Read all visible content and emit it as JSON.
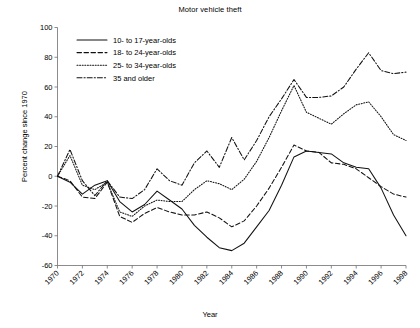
{
  "chart_data": {
    "type": "line",
    "title": "Motor vehicle theft",
    "xlabel": "Year",
    "ylabel": "Percent change since 1970",
    "xlim": [
      1970,
      1998
    ],
    "ylim": [
      -60,
      100
    ],
    "yticks": [
      100,
      80,
      60,
      40,
      20,
      0,
      -20,
      -40,
      -60
    ],
    "xticks": [
      1970,
      1972,
      1974,
      1976,
      1978,
      1980,
      1982,
      1984,
      1986,
      1988,
      1990,
      1992,
      1994,
      1996,
      1998
    ],
    "grid": false,
    "legend_position": "upper-left",
    "x": [
      1970,
      1971,
      1972,
      1973,
      1974,
      1975,
      1976,
      1977,
      1978,
      1979,
      1980,
      1981,
      1982,
      1983,
      1984,
      1985,
      1986,
      1987,
      1988,
      1989,
      1990,
      1991,
      1992,
      1993,
      1994,
      1995,
      1996,
      1997,
      1998
    ],
    "series": [
      {
        "name": "10- to 17-year-olds",
        "style": "solid",
        "values": [
          0,
          -4,
          -12,
          -6,
          -3,
          -17,
          -24,
          -19,
          -10,
          -16,
          -22,
          -33,
          -41,
          -48,
          -50,
          -45,
          -34,
          -23,
          -6,
          13,
          17,
          16,
          15,
          9,
          6,
          5,
          -8,
          -26,
          -40
        ]
      },
      {
        "name": "18- to 24-year-olds",
        "style": "dashed",
        "values": [
          0,
          -3,
          -14,
          -15,
          -4,
          -27,
          -31,
          -25,
          -21,
          -24,
          -26,
          -26,
          -24,
          -28,
          -34,
          -30,
          -20,
          -8,
          6,
          21,
          17,
          16,
          9,
          8,
          5,
          -1,
          -7,
          -12,
          -14
        ]
      },
      {
        "name": "25- to 34-year-olds",
        "style": "dotted",
        "values": [
          0,
          14,
          -6,
          -9,
          -4,
          -24,
          -27,
          -20,
          -16,
          -17,
          -17,
          -9,
          -3,
          -5,
          -9,
          -2,
          10,
          26,
          44,
          61,
          43,
          39,
          35,
          42,
          48,
          50,
          40,
          28,
          24
        ]
      },
      {
        "name": "35 and older",
        "style": "dashdot",
        "values": [
          0,
          18,
          -3,
          -13,
          -3,
          -14,
          -15,
          -9,
          5,
          -3,
          -6,
          9,
          17,
          6,
          26,
          11,
          24,
          40,
          52,
          65,
          53,
          53,
          54,
          60,
          72,
          83,
          71,
          69,
          70
        ]
      }
    ]
  },
  "legend": {
    "items": [
      {
        "label": "10- to 17-year-olds",
        "style": "solid"
      },
      {
        "label": "18- to 24-year-olds",
        "style": "dashed"
      },
      {
        "label": "25- to 34-year-olds",
        "style": "dotted"
      },
      {
        "label": "35 and older",
        "style": "dashdot"
      }
    ]
  }
}
